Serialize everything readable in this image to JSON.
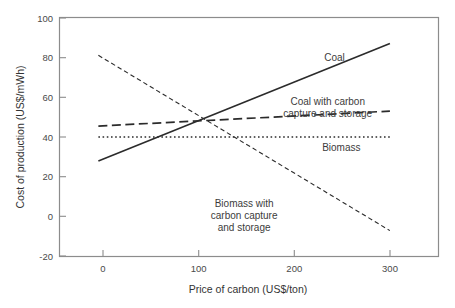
{
  "chart_data": {
    "type": "line",
    "title": "",
    "xlabel": "Price of carbon (US$/ton)",
    "ylabel": "Cost of production (US$/mWh)",
    "xlim": [
      -40,
      350
    ],
    "ylim": [
      -20,
      100
    ],
    "xticks": [
      0,
      100,
      200,
      300
    ],
    "xtick_labels": [
      "0",
      "100",
      "200",
      "300"
    ],
    "yticks": [
      -20,
      0,
      20,
      40,
      60,
      80,
      100
    ],
    "ytick_labels": [
      "-20",
      "0",
      "20",
      "40",
      "60",
      "80",
      "100"
    ],
    "grid": false,
    "legend_position": "inline-labels",
    "frame_color": "#8c8c8c",
    "line_color": "#2b2b2b",
    "series": [
      {
        "name": "Coal",
        "label": "Coal",
        "style": "solid",
        "x": [
          0,
          300
        ],
        "values": [
          28,
          87
        ],
        "label_lines": [
          "Coal"
        ],
        "label_x": 243,
        "label_y": 78
      },
      {
        "name": "Coal with carbon capture and storage",
        "label": "Coal with carbon capture and storage",
        "style": "long-dash",
        "x": [
          0,
          300
        ],
        "values": [
          45.5,
          53
        ],
        "label_lines": [
          "Coal with carbon",
          "capture and storage"
        ],
        "label_x": 236,
        "label_y": 56
      },
      {
        "name": "Biomass",
        "label": "Biomass",
        "style": "dotted",
        "x": [
          0,
          300
        ],
        "values": [
          40,
          40
        ],
        "label_lines": [
          "Biomass"
        ],
        "label_x": 250,
        "label_y": 33
      },
      {
        "name": "Biomass with carbon capture and storage",
        "label": "Biomass with carbon capture and storage",
        "style": "short-dash",
        "x": [
          0,
          300
        ],
        "values": [
          81,
          -7
        ],
        "label_lines": [
          "Biomass with",
          "carbon capture",
          "and storage"
        ],
        "label_x": 150,
        "label_y": 5
      }
    ]
  }
}
